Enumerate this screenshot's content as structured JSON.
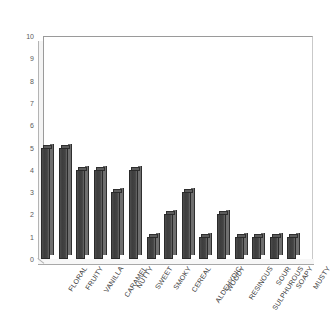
{
  "chart_data": {
    "type": "bar",
    "title": "",
    "subtitle": "",
    "xlabel": "",
    "ylabel": "",
    "categories": [
      "FLORAL",
      "FRUITY",
      "VANILLA",
      "CARAMEL",
      "NUTTY",
      "SWEET",
      "SMOKY",
      "CEREAL",
      "ALDEHYDIC",
      "WOODY",
      "RESINOUS",
      "SULPHUROUS",
      "SOUR",
      "SOAPY",
      "MUSTY"
    ],
    "values": [
      5,
      5,
      4,
      4,
      3,
      4,
      1,
      2,
      3,
      1,
      2,
      1,
      1,
      1,
      1
    ],
    "ylim": [
      0,
      10
    ],
    "y_ticks": [
      0,
      1,
      2,
      3,
      4,
      5,
      6,
      7,
      8,
      9,
      10
    ],
    "y_tick_labels": [
      "0",
      "1",
      "2",
      "3",
      "4",
      "5",
      "6",
      "7",
      "8",
      "9",
      "10"
    ],
    "grid": false,
    "legend": null,
    "legend_position": "none",
    "bar_color": "#3f3f3f",
    "bar_side_color": "#6f6f6f",
    "bar_top_color": "#5d5d5d",
    "axis_color": "#9a9a9a",
    "background_color": "#ffffff",
    "style": "3d-column"
  }
}
